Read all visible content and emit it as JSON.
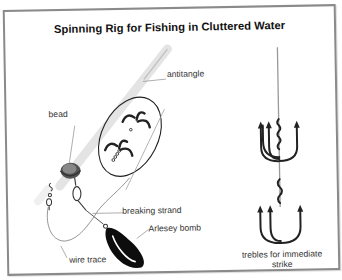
{
  "title": "Spinning Rig for Fishing in Cluttered Water",
  "labels": {
    "antitangle": "antitangle",
    "bead": "bead",
    "breaking_strand": "breaking strand",
    "arlesey_bomb": "Arlesey bomb",
    "wire_trace": "wire trace",
    "trebles_line1": "trebles for immediate",
    "trebles_line2": "strike"
  },
  "colors": {
    "frame_border": "#8a8a8a",
    "ink": "#222222",
    "tube": "#e6e6e6",
    "leader_line": "#9a9a9a"
  }
}
